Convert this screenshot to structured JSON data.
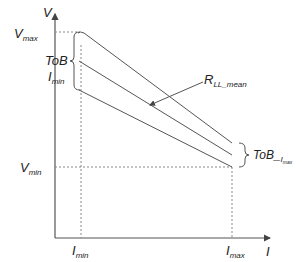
{
  "diagram": {
    "axes": {
      "y_label": "V",
      "x_label": "I"
    },
    "labels": {
      "v_max": {
        "main": "V",
        "sub": "max"
      },
      "v_min": {
        "main": "V",
        "sub": "min"
      },
      "i_min_axis": {
        "main": "I",
        "sub": "min"
      },
      "i_max_axis": {
        "main": "I",
        "sub": "max"
      },
      "tob_left": "ToB",
      "i_min_bracket": {
        "main": "I",
        "sub": "min"
      },
      "r_ll_mean": {
        "main": "R",
        "sub": "LL_mean"
      },
      "tob_imax": {
        "main": "ToB_",
        "sub_main": "I",
        "sub_sub": "max"
      }
    },
    "colors": {
      "line": "#555555",
      "dashed": "#888888",
      "text": "#222222"
    }
  }
}
